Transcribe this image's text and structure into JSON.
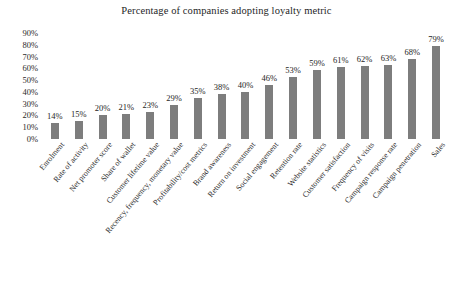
{
  "chart_data": {
    "type": "bar",
    "title": "Percentage of companies adopting loyalty metric",
    "xlabel": "",
    "ylabel": "",
    "ylim": [
      0,
      90
    ],
    "grid": false,
    "legend": null,
    "value_suffix": "%",
    "bar_color": "#7d7d7d",
    "y_ticks": [
      "90%",
      "80%",
      "70%",
      "60%",
      "50%",
      "40%",
      "30%",
      "20%",
      "10%",
      "0%"
    ],
    "y_tick_values": [
      90,
      80,
      70,
      60,
      50,
      40,
      30,
      20,
      10,
      0
    ],
    "categories": [
      "Enrolment",
      "Rate of activity",
      "Net promoter score",
      "Share of wallet",
      "Customer lifetime value",
      "Recency, frequency, monetary value",
      "Profitability/cost metrics",
      "Brand awareness",
      "Return on investment",
      "Social engagement",
      "Retention rate",
      "Website statistics",
      "Customer satisfaction",
      "Frequency of visits",
      "Campaign response rate",
      "Campaign penetration",
      "Sales"
    ],
    "values": [
      14,
      15,
      20,
      21,
      23,
      29,
      35,
      38,
      40,
      46,
      53,
      59,
      61,
      62,
      63,
      68,
      79
    ],
    "data_labels": [
      "14%",
      "15%",
      "20%",
      "21%",
      "23%",
      "29%",
      "35%",
      "38%",
      "40%",
      "46%",
      "53%",
      "59%",
      "61%",
      "62%",
      "63%",
      "68%",
      "79%"
    ]
  }
}
